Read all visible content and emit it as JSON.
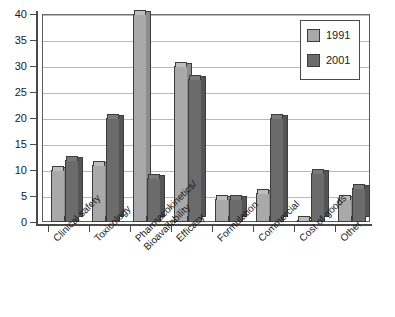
{
  "chart_data": {
    "type": "bar",
    "title": "",
    "xlabel": "",
    "ylabel": "",
    "ylim": [
      0,
      40
    ],
    "ytick_step": 5,
    "yticks": [
      0,
      5,
      10,
      15,
      20,
      25,
      30,
      35,
      40
    ],
    "grid": true,
    "legend_position": "top-right",
    "categories": [
      "Clinical safety",
      "Toxicology",
      "Pharmacokinetics/ Bioavailability",
      "Efficacy",
      "Formulation",
      "Commercial",
      "Cost of goods",
      "Other"
    ],
    "category_lines": [
      [
        "Clinical safety"
      ],
      [
        "Toxicology"
      ],
      [
        "Pharmacokinetics/",
        "Bioavailability"
      ],
      [
        "Efficacy"
      ],
      [
        "Formulation"
      ],
      [
        "Commercial"
      ],
      [
        "Cost of goods"
      ],
      [
        "Other"
      ]
    ],
    "series": [
      {
        "name": "1991",
        "color": "#a9a9a9",
        "values": [
          10,
          11,
          40,
          30,
          4.5,
          5.5,
          0.3,
          4.5
        ]
      },
      {
        "name": "2001",
        "color": "#6b6b6b",
        "values": [
          12,
          20,
          8.5,
          27.5,
          4.5,
          20,
          9.5,
          6.5
        ]
      }
    ]
  },
  "legend": {
    "entries": [
      {
        "label": "1991"
      },
      {
        "label": "2001"
      }
    ]
  },
  "axis": {
    "y_labels": [
      "0",
      "5",
      "10",
      "15",
      "20",
      "25",
      "30",
      "35",
      "40"
    ]
  }
}
